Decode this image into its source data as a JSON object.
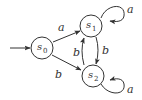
{
  "diagram": {
    "type": "finite-automaton",
    "initial_state": "s0",
    "states": [
      {
        "id": "s0",
        "name": "s",
        "subscript": "0"
      },
      {
        "id": "s1",
        "name": "s",
        "subscript": "1"
      },
      {
        "id": "s2",
        "name": "s",
        "subscript": "2"
      }
    ],
    "transitions": [
      {
        "from": "s0",
        "to": "s1",
        "label": "a"
      },
      {
        "from": "s0",
        "to": "s2",
        "label": "b"
      },
      {
        "from": "s1",
        "to": "s2",
        "label": "b"
      },
      {
        "from": "s2",
        "to": "s1",
        "label": "b"
      },
      {
        "from": "s1",
        "to": "s1",
        "label": "a"
      },
      {
        "from": "s2",
        "to": "s2",
        "label": "a"
      }
    ]
  }
}
